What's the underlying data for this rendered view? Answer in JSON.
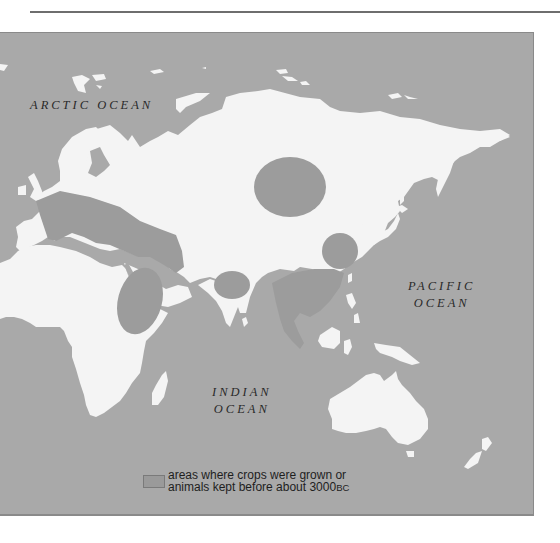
{
  "colors": {
    "ocean": "#a9a9a9",
    "land": "#f4f4f4",
    "farming_region": "#9c9c9c",
    "frame_border": "#8a8a8a",
    "rule": "#6e6e6e",
    "label_text": "#2a2a2a"
  },
  "labels": {
    "arctic": "ARCTIC OCEAN",
    "pacific": "PACIFIC\nOCEAN",
    "indian": "INDIAN\nOCEAN"
  },
  "legend": {
    "swatch": "farming-region-swatch",
    "line1": "areas where crops were grown or",
    "line2_main": "animals kept before about 3000",
    "line2_suffix": "BC"
  },
  "regions": [
    {
      "name": "fertile-crescent-and-mediterranean"
    },
    {
      "name": "nile-ethiopia"
    },
    {
      "name": "indus-valley"
    },
    {
      "name": "central-asia-steppe"
    },
    {
      "name": "yellow-river-china"
    },
    {
      "name": "southeast-asia"
    }
  ]
}
